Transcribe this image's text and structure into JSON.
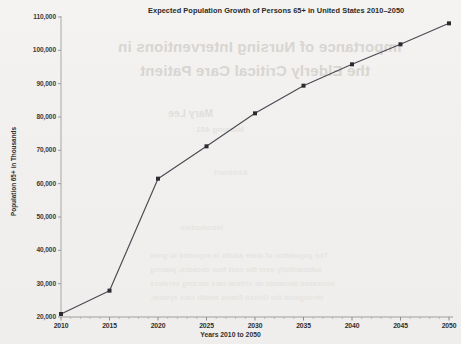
{
  "chart_data": {
    "type": "line",
    "title": "Expected Population Growth of Persons 65+ in United States 2010–2050",
    "xlabel": "Years 2010 to 2050",
    "ylabel": "Population 65+ in Thousands",
    "x": [
      2010,
      2015,
      2020,
      2025,
      2030,
      2035,
      2040,
      2045,
      2050
    ],
    "categories": [
      "2010",
      "2015",
      "2020",
      "2025",
      "2030",
      "2035",
      "2040",
      "2045",
      "2050"
    ],
    "values": [
      20900,
      27900,
      61500,
      71200,
      81100,
      89400,
      95800,
      101800,
      108100
    ],
    "series": [
      {
        "name": "Population 65+",
        "values": [
          20900,
          27900,
          61500,
          71200,
          81100,
          89400,
          95800,
          101800,
          108100
        ]
      }
    ],
    "xlim": [
      2010,
      2050
    ],
    "ylim": [
      20000,
      110000
    ],
    "ytick_labels": [
      "20,000",
      "30,000",
      "40,000",
      "50,000",
      "60,000",
      "70,000",
      "80,000",
      "90,000",
      "100,000",
      "110,000"
    ],
    "ytick_values": [
      20000,
      30000,
      40000,
      50000,
      60000,
      70000,
      80000,
      90000,
      100000,
      110000
    ],
    "xtick_labels": [
      "2010",
      "2015",
      "2020",
      "2025",
      "2030",
      "2035",
      "2040",
      "2045",
      "2050"
    ],
    "grid": false,
    "legend": "none",
    "line_color": "#4a4a52",
    "marker_color": "#2b2b30",
    "axis_color": "#b9b8b6",
    "background_color": "#f1f0ee"
  },
  "bleed_through": {
    "line1": "Importance of Nursing Interventions in",
    "line2": "the Elderly Critical Care Patient",
    "line3": "Mary Lee",
    "line4": "Nursing 401",
    "line5": "Abstract",
    "line6": "Introduction",
    "line7": "The population of older adults is expected to grow",
    "line8": "substantially over the next four decades, placing",
    "line9": "increased demands on critical care nursing services",
    "line10": "throughout the United States health care system."
  }
}
